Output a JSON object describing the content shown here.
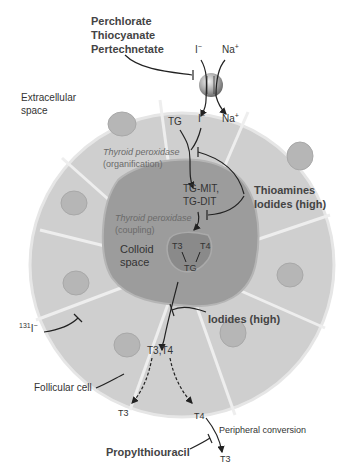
{
  "diagram": {
    "inhibitors_top": [
      "Perchlorate",
      "Thiocyanate",
      "Pertechnetate"
    ],
    "transporter": {
      "outside_ion_1": "I",
      "outside_ion_1_sup": "−",
      "outside_ion_2": "Na",
      "outside_ion_2_sup": "+",
      "inside_ion_1": "I",
      "inside_ion_1_sup": "−",
      "inside_ion_2": "Na",
      "inside_ion_2_sup": "+"
    },
    "extracellular_label": [
      "Extracellular",
      "space"
    ],
    "tg_label": "TG",
    "enzyme_1": {
      "name": "Thyroid peroxidase",
      "step": "(organification)"
    },
    "intermediates": [
      "TG-MIT,",
      "TG-DIT"
    ],
    "enzyme_2": {
      "name": "Thyroid peroxidase",
      "step": "(coupling)"
    },
    "inhibitors_mid": [
      "Thioamines",
      "Iodides (high)"
    ],
    "colloid_label": [
      "Colloid",
      "space"
    ],
    "colloid_complex": {
      "t3": "T3",
      "t4": "T4",
      "tg": "TG"
    },
    "radioiodine": {
      "mass": "131",
      "symbol": "I",
      "charge": "−"
    },
    "inhibitor_release": "Iodides (high)",
    "released": "T3,T4",
    "cell_label": "Follicular cell",
    "out_t3": "T3",
    "out_t4": "T4",
    "peripheral_label": "Peripheral conversion",
    "peripheral_t3": "T3",
    "inhibitor_peripheral": "Propylthiouracil",
    "colors": {
      "cell_fill": "#c9c9c9",
      "cell_border": "#e8e8e8",
      "nucleus": "#b4b4b4",
      "colloid": "#9a9a9a",
      "complex": "#888888",
      "arrow": "#222222"
    }
  }
}
